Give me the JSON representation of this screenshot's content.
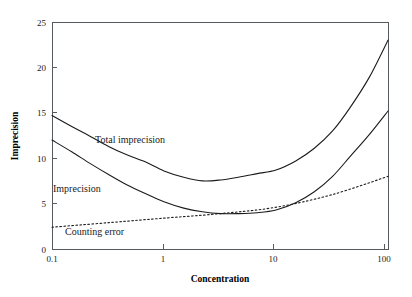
{
  "chart_data": {
    "type": "line",
    "title": "",
    "xlabel": "Concentration",
    "ylabel": "Imprecision",
    "xscale": "log",
    "xlim": [
      0.1,
      100
    ],
    "ylim": [
      0,
      25
    ],
    "grid": false,
    "legend_position": "inline-annotations",
    "xticks": [
      0.1,
      1,
      10,
      100
    ],
    "xticklabels": [
      "0.1",
      "1",
      "10",
      "100"
    ],
    "yticks": [
      0,
      5,
      10,
      15,
      20,
      25
    ],
    "yticklabels": [
      "0",
      "5",
      "10",
      "15",
      "20",
      "25"
    ],
    "series": [
      {
        "name": "Total imprecision",
        "style": "solid",
        "color": "#1b1b1b",
        "x": [
          0.1,
          0.15,
          0.22,
          0.32,
          0.46,
          0.68,
          1.0,
          1.5,
          2.2,
          3.2,
          4.6,
          6.8,
          10.0,
          15.0,
          22.0,
          32.0,
          46.0,
          68.0,
          100.0
        ],
        "y": [
          14.7,
          13.5,
          12.4,
          11.3,
          10.4,
          9.6,
          8.6,
          7.9,
          7.5,
          7.6,
          7.9,
          8.3,
          8.7,
          9.7,
          11.1,
          13.0,
          15.6,
          18.9,
          23.0
        ]
      },
      {
        "name": "Imprecision",
        "style": "solid",
        "color": "#1b1b1b",
        "x": [
          0.1,
          0.15,
          0.22,
          0.32,
          0.46,
          0.68,
          1.0,
          1.5,
          2.2,
          3.2,
          4.6,
          6.8,
          10.0,
          15.0,
          22.0,
          32.0,
          46.0,
          68.0,
          100.0
        ],
        "y": [
          12.0,
          10.7,
          9.4,
          8.2,
          7.1,
          6.1,
          5.2,
          4.5,
          4.1,
          3.9,
          3.9,
          4.0,
          4.3,
          5.1,
          6.3,
          8.0,
          10.2,
          12.6,
          15.2
        ]
      },
      {
        "name": "Counting error",
        "style": "dotted",
        "color": "#1b1b1b",
        "x": [
          0.1,
          0.32,
          1.0,
          3.2,
          10.0,
          32.0,
          100.0
        ],
        "y": [
          2.4,
          2.9,
          3.4,
          3.9,
          4.6,
          6.0,
          8.0
        ]
      }
    ],
    "annotations": [
      {
        "text": "Total imprecision",
        "x_px": 95,
        "y_px": 143
      },
      {
        "text": "Imprecision",
        "x_px": 53,
        "y_px": 192
      },
      {
        "text": "Counting error",
        "x_px": 65,
        "y_px": 235
      }
    ]
  },
  "axes": {
    "x_title": "Concentration",
    "y_title": "Imprecision"
  }
}
